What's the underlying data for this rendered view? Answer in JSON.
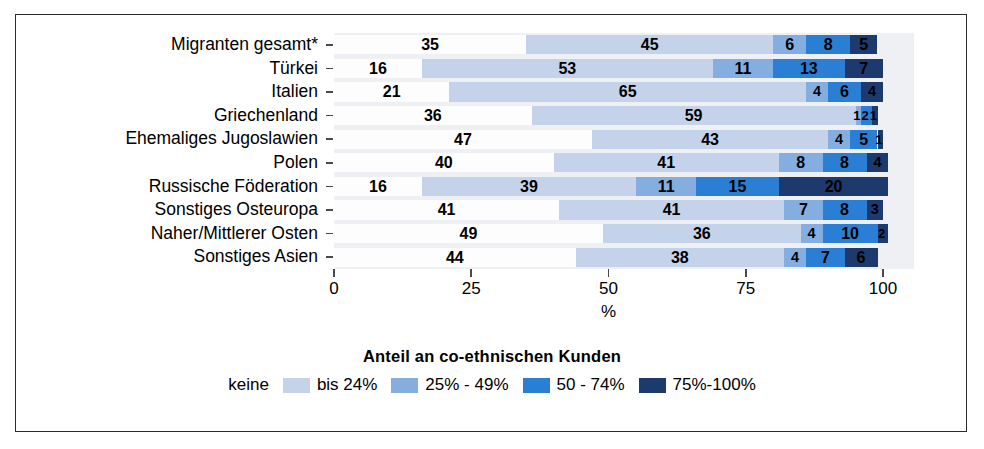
{
  "chart_data": {
    "type": "bar",
    "orientation": "horizontal",
    "stacked": true,
    "stacked_percent": true,
    "title": "",
    "xlabel": "%",
    "ylabel": "",
    "xlim": [
      0,
      100
    ],
    "xticks": [
      0,
      25,
      50,
      75,
      100
    ],
    "xticklabels": [
      "0",
      "25",
      "50",
      "75",
      "100"
    ],
    "grid": false,
    "legend_position": "bottom",
    "legend_title": "Anteil an co-ethnischen Kunden",
    "categories": [
      "Migranten gesamt*",
      "Türkei",
      "Italien",
      "Griechenland",
      "Ehemaliges Jugoslawien",
      "Polen",
      "Russische Föderation",
      "Sonstiges Osteuropa",
      "Naher/Mittlerer Osten",
      "Sonstiges Asien"
    ],
    "series": [
      {
        "name": "keine",
        "color": "#fdfdfd",
        "values": [
          35,
          16,
          21,
          36,
          47,
          40,
          16,
          41,
          49,
          44
        ]
      },
      {
        "name": "bis 24%",
        "color": "#c5d3ea",
        "values": [
          45,
          53,
          65,
          59,
          43,
          41,
          39,
          41,
          36,
          38
        ]
      },
      {
        "name": "25% - 49%",
        "color": "#84aee0",
        "values": [
          6,
          11,
          4,
          1,
          4,
          8,
          11,
          7,
          4,
          4
        ]
      },
      {
        "name": "50 - 74%",
        "color": "#2a7fd4",
        "values": [
          8,
          13,
          6,
          2,
          5,
          8,
          15,
          8,
          10,
          7
        ]
      },
      {
        "name": "75%-100%",
        "color": "#1c3a6e",
        "values": [
          5,
          7,
          4,
          1,
          1,
          4,
          20,
          3,
          2,
          6
        ]
      }
    ]
  },
  "legend": {
    "title": "Anteil an co-ethnischen Kunden",
    "items": [
      {
        "label": "keine",
        "color": "#fdfdfd",
        "show_swatch": false
      },
      {
        "label": "bis 24%",
        "color": "#c5d3ea",
        "show_swatch": true
      },
      {
        "label": "25% - 49%",
        "color": "#84aee0",
        "show_swatch": true
      },
      {
        "label": "50 - 74%",
        "color": "#2a7fd4",
        "show_swatch": true
      },
      {
        "label": "75%-100%",
        "color": "#1c3a6e",
        "show_swatch": true
      }
    ]
  },
  "axis": {
    "x_title": "%",
    "ticks": [
      "0",
      "25",
      "50",
      "75",
      "100"
    ]
  },
  "colors": {
    "panel_background": "#eef0f4",
    "frame_border": "#2b2b2b",
    "tick": "#4a4a4a",
    "text": "#000000"
  }
}
